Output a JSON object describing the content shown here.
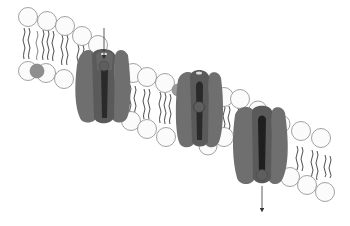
{
  "diagram": {
    "title": "",
    "type": "lipid bilayer with ion channel transport sequence",
    "colors": {
      "background": "#ffffff",
      "head_fill": "#fbfbfb",
      "head_stroke": "#8a8a8a",
      "tail": "#3a3a3a",
      "protein": "#6f6f6f",
      "protein_dark": "#545454",
      "pore": "#2a2a2a",
      "ion": "#5e5e5e",
      "arrow": "#333333"
    },
    "channels": [
      {
        "id": "channel-1",
        "state": "ion entering from top",
        "ion_position": "top"
      },
      {
        "id": "channel-2",
        "state": "ion inside pore",
        "ion_position": "middle"
      },
      {
        "id": "channel-3",
        "state": "ion exiting at bottom",
        "ion_position": "bottom"
      }
    ],
    "arrows": [
      {
        "id": "entry-arrow",
        "direction": "down",
        "location": "above channel 1"
      },
      {
        "id": "exit-arrow",
        "direction": "down",
        "location": "below channel 3"
      }
    ]
  }
}
